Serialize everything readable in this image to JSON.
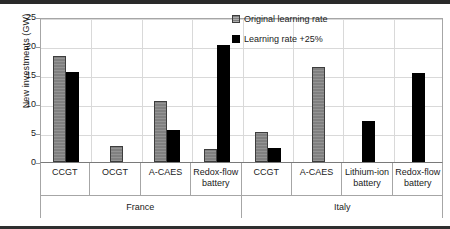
{
  "chart_data": {
    "type": "bar",
    "title": "",
    "xlabel": "",
    "ylabel": "New investments (GW)",
    "ylim": [
      0,
      25
    ],
    "yticks": [
      0,
      5,
      10,
      15,
      20,
      25
    ],
    "grid": true,
    "legend_position": "top-right",
    "categories": [
      "CCGT",
      "OCGT",
      "A-CAES",
      "Redox-flow battery",
      "CCGT",
      "A-CAES",
      "Lithium-ion battery",
      "Redox-flow battery"
    ],
    "groups": [
      {
        "label": "France",
        "span": 4
      },
      {
        "label": "Italy",
        "span": 4
      }
    ],
    "series": [
      {
        "name": "Original learning rate",
        "color": "#808080",
        "values": [
          18.3,
          2.8,
          10.6,
          2.3,
          5.2,
          16.4,
          0,
          0
        ]
      },
      {
        "name": "Learning rate +25%",
        "color": "#000000",
        "values": [
          15.5,
          0,
          5.6,
          20.2,
          2.5,
          0,
          7.1,
          15.4
        ]
      }
    ]
  },
  "legend": {
    "items": [
      {
        "label": "Original learning rate",
        "swatch": "orig"
      },
      {
        "label": "Learning rate +25%",
        "swatch": "plus"
      }
    ]
  },
  "axis": {
    "y_title": "New investments (GW)"
  }
}
